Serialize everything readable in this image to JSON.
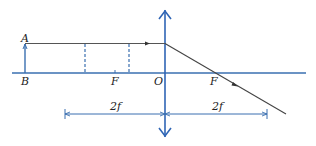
{
  "diagram": {
    "colors": {
      "axis": "#3a6fb0",
      "lens": "#2f65b5",
      "ray": "#333333",
      "dashed": "#3a6fb0",
      "dimension": "#3a6fb0",
      "text": "#222222"
    },
    "labels": {
      "point_a": "A",
      "point_b": "B",
      "focus_left": "F",
      "optical_center": "O",
      "focus_right": "F",
      "dim_left": "2f",
      "dim_right": "2f"
    },
    "elements": {
      "principal_axis": "horizontal line",
      "lens": "convex lens (double-headed vertical arrow)",
      "object": "object AB standing on axis",
      "ray": "ray from A parallel to axis, refracted through right focus F",
      "dashed_lines": 2,
      "dimension_lines": [
        "2f left of lens",
        "2f right of lens"
      ]
    }
  }
}
